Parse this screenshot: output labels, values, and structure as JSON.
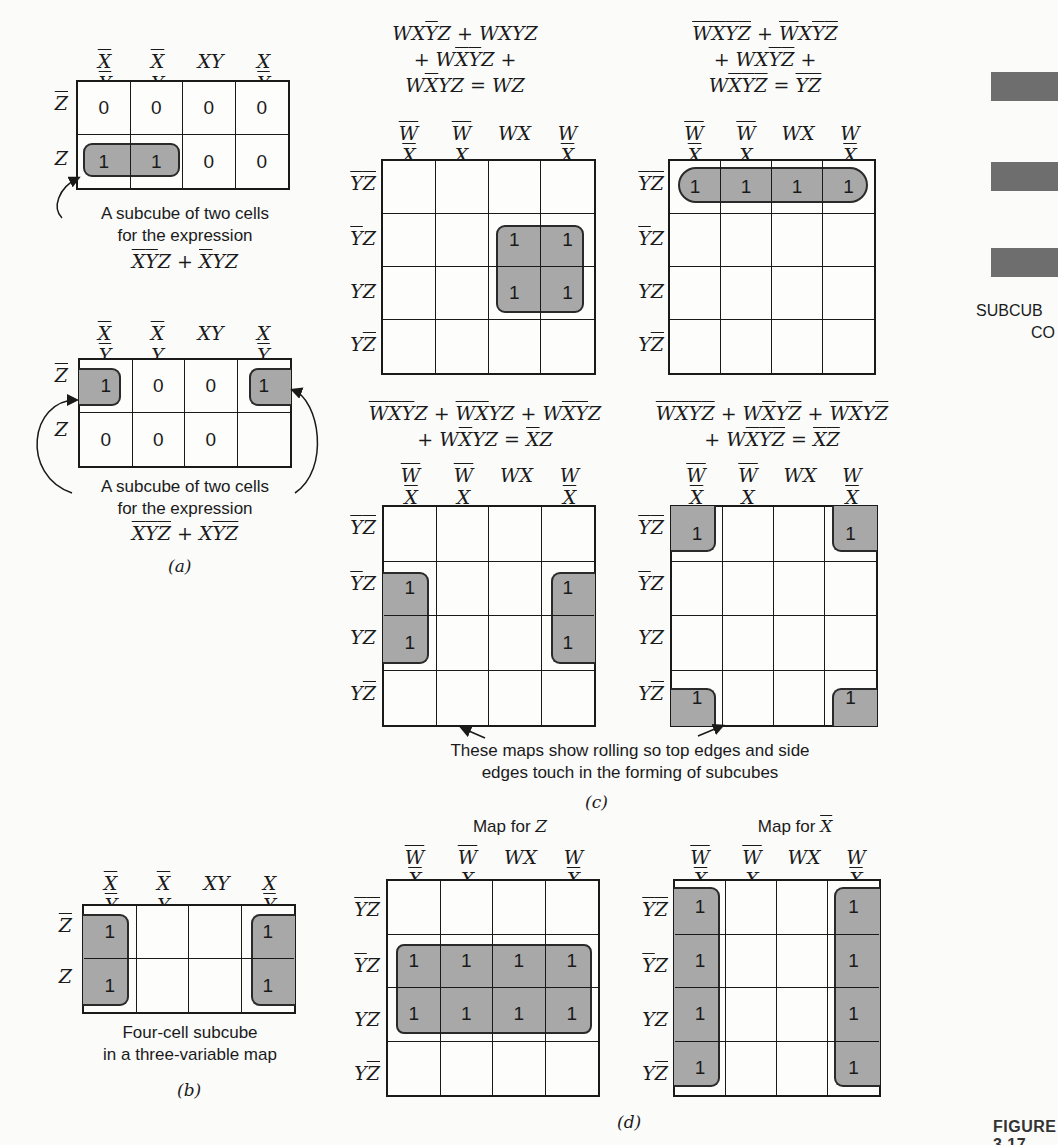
{
  "figure": {
    "label": "FIGURE 3.17",
    "side_caption_line1": "SUBCUB",
    "side_caption_line2": "CO"
  },
  "panel_a": {
    "label": "(a)",
    "map1": {
      "col_labels": [
        "XY",
        "XY",
        "XY",
        "XY"
      ],
      "col_overlines": [
        [
          true,
          true
        ],
        [
          true,
          false
        ],
        [
          false,
          false
        ],
        [
          false,
          true
        ]
      ],
      "row_labels": [
        "Z",
        "Z"
      ],
      "row_overlines": [
        true,
        false
      ],
      "cells": [
        [
          "0",
          "0",
          "0",
          "0"
        ],
        [
          "1",
          "1",
          "0",
          "0"
        ]
      ],
      "caption_line1": "A subcube of two cells",
      "caption_line2": "for the expression",
      "expression": "X̄ȲZ + X̄YZ"
    },
    "map2": {
      "col_labels": [
        "XY",
        "XY",
        "XY",
        "XY"
      ],
      "row_labels": [
        "Z",
        "Z"
      ],
      "cells": [
        [
          "1",
          "0",
          "0",
          "1"
        ],
        [
          "0",
          "0",
          "0",
          ""
        ]
      ],
      "caption_line1": "A subcube of two cells",
      "caption_line2": "for the expression",
      "expression": "X̄ȲZ̄ + XȲZ̄"
    }
  },
  "panel_b": {
    "label": "(b)",
    "col_labels": [
      "XY",
      "XY",
      "XY",
      "XY"
    ],
    "row_labels": [
      "Z",
      "Z"
    ],
    "cells": [
      [
        "1",
        "",
        "",
        "1"
      ],
      [
        "1",
        "",
        "",
        "1"
      ]
    ],
    "caption_line1": "Four-cell subcube",
    "caption_line2": "in a three-variable map"
  },
  "panel_c": {
    "label": "(c)",
    "note_line1": "These maps show rolling so top edges and side",
    "note_line2": "edges touch in the forming of subcubes",
    "col_labels": [
      "WX",
      "WX",
      "WX",
      "WX"
    ],
    "row_labels": [
      "YZ",
      "YZ",
      "YZ",
      "YZ"
    ],
    "maps": [
      {
        "equation_lines": [
          "WXȲZ + WXYZ",
          "+ WX̄ȲZ +",
          "WX̄YZ = WZ"
        ],
        "cells": [
          [
            "",
            "",
            "",
            ""
          ],
          [
            "",
            "",
            "1",
            "1"
          ],
          [
            "",
            "",
            "1",
            "1"
          ],
          [
            "",
            "",
            "",
            ""
          ]
        ]
      },
      {
        "equation_lines": [
          "W̄X̄ȲZ̄ + W̄XȲZ̄",
          "+ WXȲZ̄ +",
          "WX̄ȲZ̄ = ȲZ̄"
        ],
        "cells": [
          [
            "1",
            "1",
            "1",
            "1"
          ],
          [
            "",
            "",
            "",
            ""
          ],
          [
            "",
            "",
            "",
            ""
          ],
          [
            "",
            "",
            "",
            ""
          ]
        ]
      },
      {
        "equation_lines": [
          "W̄X̄ȲZ + W̄X̄YZ + WX̄ȲZ",
          "+ WX̄YZ = X̄Z"
        ],
        "cells": [
          [
            "",
            "",
            "",
            ""
          ],
          [
            "1",
            "",
            "",
            "1"
          ],
          [
            "1",
            "",
            "",
            "1"
          ],
          [
            "",
            "",
            "",
            ""
          ]
        ]
      },
      {
        "equation_lines": [
          "W̄X̄ȲZ̄ + WX̄YZ̄ + W̄X̄YZ̄",
          "+ WX̄ȲZ̄ = X̄Z̄"
        ],
        "cells": [
          [
            "1",
            "",
            "",
            "1"
          ],
          [
            "",
            "",
            "",
            ""
          ],
          [
            "",
            "",
            "",
            ""
          ],
          [
            "1",
            "",
            "",
            "1"
          ]
        ]
      }
    ]
  },
  "panel_d": {
    "label": "(d)",
    "col_labels": [
      "WX",
      "WX",
      "WX",
      "WX"
    ],
    "row_labels": [
      "YZ",
      "YZ",
      "YZ",
      "YZ"
    ],
    "maps": [
      {
        "title_prefix": "Map for ",
        "title_var": "Z",
        "cells": [
          [
            "",
            "",
            "",
            ""
          ],
          [
            "1",
            "1",
            "1",
            "1"
          ],
          [
            "1",
            "1",
            "1",
            "1"
          ],
          [
            "",
            "",
            "",
            ""
          ]
        ]
      },
      {
        "title_prefix": "Map for ",
        "title_var": "X",
        "cells": [
          [
            "1",
            "",
            "",
            "1"
          ],
          [
            "1",
            "",
            "",
            "1"
          ],
          [
            "1",
            "",
            "",
            "1"
          ],
          [
            "1",
            "",
            "",
            "1"
          ]
        ]
      }
    ]
  },
  "colors": {
    "subcube_fill": "#a8a8a8",
    "side_bar": "#6e6e6e",
    "line": "#1a1a1a"
  }
}
